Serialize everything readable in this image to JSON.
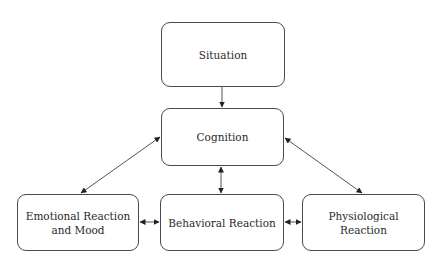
{
  "diagram": {
    "type": "flowchart",
    "nodes": [
      {
        "id": "situation",
        "label": "Situation"
      },
      {
        "id": "cognition",
        "label": "Cognition"
      },
      {
        "id": "emotional",
        "label": "Emotional Reaction\nand Mood"
      },
      {
        "id": "behavioral",
        "label": "Behavioral Reaction"
      },
      {
        "id": "physiological",
        "label": "Physiological Reaction"
      }
    ],
    "edges": [
      {
        "from": "situation",
        "to": "cognition",
        "direction": "forward"
      },
      {
        "from": "cognition",
        "to": "emotional",
        "direction": "both"
      },
      {
        "from": "cognition",
        "to": "behavioral",
        "direction": "both"
      },
      {
        "from": "cognition",
        "to": "physiological",
        "direction": "both"
      },
      {
        "from": "emotional",
        "to": "behavioral",
        "direction": "both"
      },
      {
        "from": "behavioral",
        "to": "physiological",
        "direction": "both"
      }
    ],
    "colors": {
      "stroke": "#4a4a4a",
      "text": "#2a2a2a",
      "background": "#ffffff"
    }
  }
}
